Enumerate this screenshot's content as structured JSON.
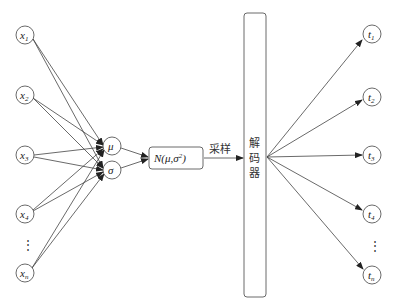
{
  "diagram": {
    "type": "vae-decoder-network",
    "inputs": [
      {
        "id": "x1",
        "base": "x",
        "sub": "1",
        "cx": 25,
        "cy": 35
      },
      {
        "id": "x2",
        "base": "x",
        "sub": "2",
        "cx": 25,
        "cy": 95
      },
      {
        "id": "x3",
        "base": "x",
        "sub": "3",
        "cx": 25,
        "cy": 155
      },
      {
        "id": "x4",
        "base": "x",
        "sub": "4",
        "cx": 25,
        "cy": 214
      },
      {
        "id": "xn",
        "base": "x",
        "sub": "n",
        "cx": 25,
        "cy": 273
      }
    ],
    "input_ellipsis": "⋮",
    "latent": [
      {
        "id": "mu",
        "label": "μ",
        "cx": 112,
        "cy": 146
      },
      {
        "id": "sigma",
        "label": "σ",
        "cx": 112,
        "cy": 170
      }
    ],
    "distribution": {
      "label_prefix": "N(μ,σ",
      "sup": "2",
      "label_suffix": ")"
    },
    "sample_label": "采样",
    "decoder": {
      "label_chars": [
        "解",
        "码",
        "器"
      ]
    },
    "outputs": [
      {
        "id": "t1",
        "base": "t",
        "sub": "1",
        "cx": 372,
        "cy": 34
      },
      {
        "id": "t2",
        "base": "t",
        "sub": "2",
        "cx": 372,
        "cy": 97
      },
      {
        "id": "t3",
        "base": "t",
        "sub": "3",
        "cx": 372,
        "cy": 155
      },
      {
        "id": "t4",
        "base": "t",
        "sub": "4",
        "cx": 372,
        "cy": 214
      },
      {
        "id": "tn",
        "base": "t",
        "sub": "n",
        "cx": 372,
        "cy": 275
      }
    ],
    "output_ellipsis": "⋮",
    "colors": {
      "stroke": "#444444",
      "text": "#222222",
      "background": "#ffffff"
    }
  }
}
